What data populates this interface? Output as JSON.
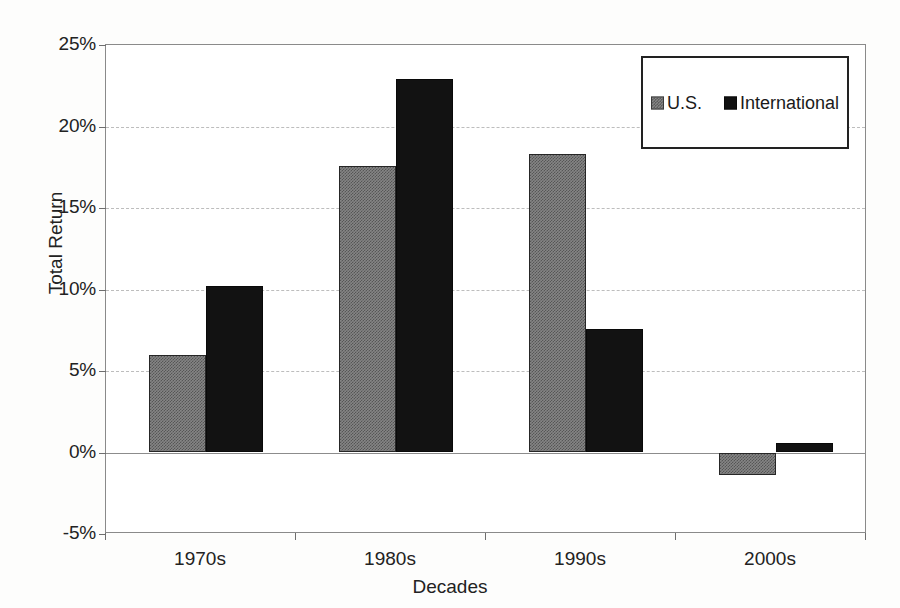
{
  "chart_data": {
    "type": "bar",
    "title": "",
    "xlabel": "Decades",
    "ylabel": "Total Return",
    "categories": [
      "1970s",
      "1980s",
      "1990s",
      "2000s"
    ],
    "series": [
      {
        "name": "U.S.",
        "color": "#808080",
        "values": [
          6.0,
          17.6,
          18.3,
          -1.4
        ]
      },
      {
        "name": "International",
        "color": "#111111",
        "values": [
          10.2,
          22.9,
          7.6,
          0.6
        ]
      }
    ],
    "ylim": [
      -5,
      25
    ],
    "ytick_values": [
      25,
      20,
      15,
      10,
      5,
      0,
      -5
    ],
    "ytick_labels": [
      "25%",
      "20%",
      "15%",
      "10%",
      "5%",
      "0%",
      "-5%"
    ],
    "ytick_format": "percent",
    "grid": true,
    "grid_axis": "y",
    "grid_style": "dashed",
    "zero_line": true,
    "legend": {
      "position": "top-right",
      "bordered": true,
      "orientation": "horizontal",
      "entries": [
        {
          "label": "U.S.",
          "swatch": "us"
        },
        {
          "label": "International",
          "swatch": "intl"
        }
      ]
    }
  }
}
